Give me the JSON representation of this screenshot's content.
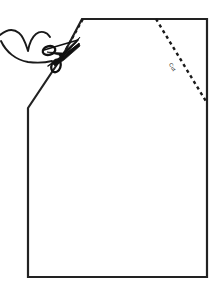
{
  "figure": {
    "background_color": "#ffffff",
    "ink_color": "#1a1a1a",
    "stroke_color": "#222222",
    "width": 221,
    "height": 297
  },
  "pattern_outline": {
    "name": "garment-body-outline",
    "description": "Rectangular pattern piece with two angled top corners",
    "fill": "#ffffff",
    "stroke": "#222222",
    "stroke_width": 2.2,
    "points": [
      {
        "x": 28,
        "y": 108
      },
      {
        "x": 62,
        "y": 57
      },
      {
        "x": 82,
        "y": 19
      },
      {
        "x": 207,
        "y": 19
      },
      {
        "x": 207,
        "y": 103
      },
      {
        "x": 207,
        "y": 277
      },
      {
        "x": 28,
        "y": 277
      }
    ],
    "vertex_labels": [
      "left-shoulder-bottom",
      "left-shoulder-notch",
      "left-neck-top",
      "top-right-corner",
      "right-shoulder-point",
      "bottom-right-corner",
      "bottom-left-corner"
    ]
  },
  "cut_lines": [
    {
      "name": "left-cut-line",
      "style": "dashed",
      "stroke": "#1a1a1a",
      "stroke_width": 2.2,
      "dash_pattern": "3 3.2",
      "from": {
        "x": 60,
        "y": 60
      },
      "to": {
        "x": 83,
        "y": 19
      },
      "label": ""
    },
    {
      "name": "right-cut-line",
      "style": "dashed",
      "stroke": "#1a1a1a",
      "stroke_width": 2.4,
      "dash_pattern": "3.2 3.4",
      "from": {
        "x": 156,
        "y": 19
      },
      "to": {
        "x": 207,
        "y": 103
      },
      "label": "Cut"
    }
  ],
  "cut_label": {
    "name": "cut-text-label",
    "text": "Cut",
    "x": 171,
    "y": 68,
    "rotation_deg": 59,
    "font_size": 5.2,
    "color": "#1a1a1a"
  },
  "scissors": {
    "name": "scissors-icon",
    "description": "Open scissors with two handle loops at lower-left and blades pointing up-right",
    "pivot": {
      "x": 61,
      "y": 55
    },
    "color": "#111111",
    "blade_tip_upper": {
      "x": 80,
      "y": 38
    },
    "blade_tip_lower": {
      "x": 78,
      "y": 44
    },
    "handle_loop_upper": {
      "cx": 49,
      "cy": 50,
      "rx": 6.4,
      "ry": 4.4,
      "angle": -16
    },
    "handle_loop_lower": {
      "cx": 56,
      "cy": 66,
      "rx": 4.6,
      "ry": 6.6,
      "angle": 22
    }
  },
  "thread_swoosh": {
    "name": "thread-hook-curve",
    "description": "Curved hook/thread line entering from the left edge and sweeping toward the scissors",
    "stroke": "#1a1a1a",
    "stroke_width": 1.9,
    "path_hint": "enters at left edge near y=36, arcs up then sweeps down-right to the scissors handles near (52, 62)"
  },
  "colors": {
    "ink": "#1a1a1a",
    "outline": "#222222",
    "paper": "#ffffff"
  }
}
